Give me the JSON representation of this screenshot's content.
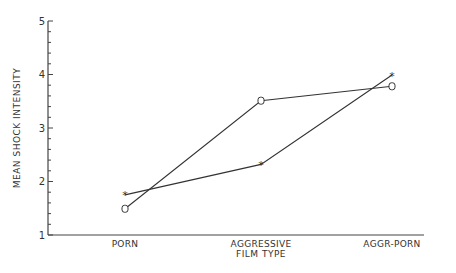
{
  "chart_data": {
    "type": "line",
    "title": "",
    "xlabel": "FILM TYPE",
    "ylabel": "MEAN SHOCK INTENSITY",
    "categories": [
      "PORN",
      "AGGRESSIVE",
      "AGGR-PORN"
    ],
    "ylim": [
      1,
      5
    ],
    "yticks": [
      1,
      2,
      3,
      4,
      5
    ],
    "grid": false,
    "legend": "none",
    "series": [
      {
        "name": "star-marker",
        "marker": "*",
        "values": [
          1.75,
          2.32,
          3.99
        ]
      },
      {
        "name": "circle-marker",
        "marker": "o",
        "values": [
          1.49,
          3.51,
          3.78
        ]
      }
    ]
  },
  "axes": {
    "y_tick_labels": [
      "1",
      "2",
      "3",
      "4",
      "5"
    ],
    "x_title": "FILM TYPE",
    "y_title": "MEAN SHOCK INTENSITY"
  },
  "colors": {
    "line": "#333333",
    "axis": "#444444"
  }
}
